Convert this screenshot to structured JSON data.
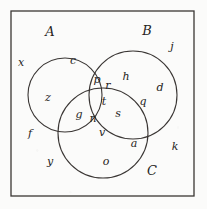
{
  "figure": {
    "type": "venn-diagram",
    "stroke_color": "#3a3634",
    "background_color": "#fbfbfa",
    "text_color": "#262422"
  },
  "universe": {
    "name": "universal-set-rectangle",
    "x": 11,
    "y": 11,
    "width": 183,
    "height": 185
  },
  "circles": [
    {
      "id": "A",
      "label": "A",
      "cx": 65,
      "cy": 95,
      "r": 37,
      "label_x": 50,
      "label_y": 31
    },
    {
      "id": "B",
      "label": "B",
      "cx": 133,
      "cy": 95,
      "r": 44,
      "label_x": 147,
      "label_y": 30
    },
    {
      "id": "C",
      "label": "C",
      "cx": 103,
      "cy": 133,
      "r": 45,
      "label_x": 152,
      "label_y": 170
    }
  ],
  "elements": [
    {
      "label": "x",
      "x": 21,
      "y": 62,
      "region": "outside-all"
    },
    {
      "label": "c",
      "x": 73,
      "y": 60,
      "region": "A-only"
    },
    {
      "label": "z",
      "x": 48,
      "y": 97,
      "region": "A-only"
    },
    {
      "label": "f",
      "x": 30,
      "y": 133,
      "region": "outside-all"
    },
    {
      "label": "y",
      "x": 50,
      "y": 161,
      "region": "outside-all"
    },
    {
      "label": "j",
      "x": 172,
      "y": 46,
      "region": "outside-all"
    },
    {
      "label": "h",
      "x": 126,
      "y": 76,
      "region": "B-only"
    },
    {
      "label": "d",
      "x": 160,
      "y": 87,
      "region": "B-only"
    },
    {
      "label": "q",
      "x": 143,
      "y": 101,
      "region": "B-only"
    },
    {
      "label": "k",
      "x": 175,
      "y": 146,
      "region": "outside-all"
    },
    {
      "label": "p",
      "x": 97,
      "y": 79,
      "region": "A-and-B"
    },
    {
      "label": "r",
      "x": 108,
      "y": 85,
      "region": "A-and-B"
    },
    {
      "label": "t",
      "x": 104,
      "y": 101,
      "region": "A-and-B-and-C"
    },
    {
      "label": "g",
      "x": 79,
      "y": 114,
      "region": "A-and-C"
    },
    {
      "label": "n",
      "x": 93,
      "y": 118,
      "region": "A-and-C"
    },
    {
      "label": "s",
      "x": 118,
      "y": 113,
      "region": "B-and-C"
    },
    {
      "label": "v",
      "x": 102,
      "y": 132,
      "region": "C-only"
    },
    {
      "label": "a",
      "x": 134,
      "y": 143,
      "region": "C-only"
    },
    {
      "label": "o",
      "x": 106,
      "y": 161,
      "region": "C-only"
    }
  ]
}
